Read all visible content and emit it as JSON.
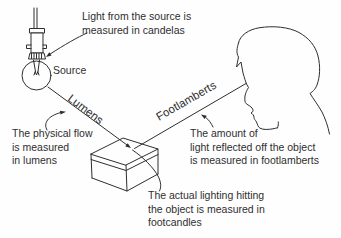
{
  "colors": {
    "ink": "#2e2e2e",
    "background": "#fefefe"
  },
  "labels": {
    "source": "Source",
    "lumens": "Lumens",
    "footlamberts": "Footlamberts"
  },
  "annotations": {
    "candelas": "Light from the source is\nmeasured in candelas",
    "lumens": "The physical flow\nis measured\nin lumens",
    "footlamberts": "The amount of\nlight reflected off the object\nis measured in footlamberts",
    "footcandles": "The actual lighting hitting\nthe object is measured in\nfootcandles"
  }
}
